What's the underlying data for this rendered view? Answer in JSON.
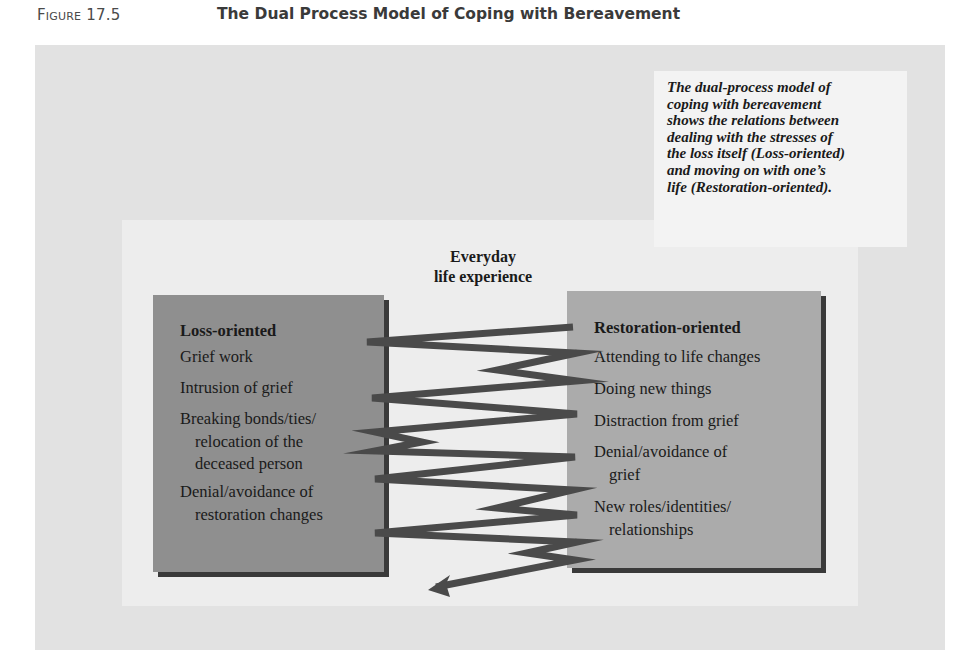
{
  "figure": {
    "label": "Figure 17.5",
    "title": "The Dual Process Model of Coping with Bereavement"
  },
  "caption": "The dual-process model of coping with bereavement shows the relations between dealing with the stresses of the loss itself (Loss-oriented) and moving on with one’s life (Restoration-oriented).",
  "caption_lines": [
    "The dual-process model of",
    "coping with bereavement",
    "shows the relations between",
    "dealing with the stresses of",
    "the loss itself (Loss-oriented)",
    "and moving on with one’s",
    "life (Restoration-oriented)."
  ],
  "center_label": {
    "line1": "Everyday",
    "line2": "life experience"
  },
  "loss_box": {
    "heading": "Loss-oriented",
    "items": [
      {
        "line1": "Grief work",
        "line2": ""
      },
      {
        "line1": "Intrusion of grief",
        "line2": ""
      },
      {
        "line1": "Breaking bonds/ties/",
        "line2": "relocation of the",
        "line3": "deceased person"
      },
      {
        "line1": "Denial/avoidance of",
        "line2": "restoration changes"
      }
    ]
  },
  "restoration_box": {
    "heading": "Restoration-oriented",
    "items": [
      {
        "line1": "Attending to life changes",
        "line2": ""
      },
      {
        "line1": "Doing new things",
        "line2": ""
      },
      {
        "line1": "Distraction from grief",
        "line2": ""
      },
      {
        "line1": "Denial/avoidance of",
        "line2": "grief"
      },
      {
        "line1": "New roles/identities/",
        "line2": "relationships"
      }
    ]
  },
  "colors": {
    "outer_panel": "#e2e2e2",
    "inner_panel": "#ededed",
    "loss_box": "#8f8f8f",
    "restoration_box": "#ababab",
    "oscillation_line": "#4a4a4a",
    "box_shadow": "#3a3a3a"
  },
  "oscillation": {
    "description": "zigzag line oscillating between Loss-oriented and Restoration-oriented boxes, ending in an arrow pointing down-left",
    "points": [
      [
        573,
        327
      ],
      [
        367,
        342
      ],
      [
        577,
        353
      ],
      [
        497,
        370
      ],
      [
        577,
        381
      ],
      [
        372,
        398
      ],
      [
        577,
        414
      ],
      [
        375,
        432
      ],
      [
        422,
        442
      ],
      [
        375,
        451
      ],
      [
        575,
        457
      ],
      [
        375,
        479
      ],
      [
        573,
        490
      ],
      [
        497,
        508
      ],
      [
        577,
        515
      ],
      [
        375,
        533
      ],
      [
        577,
        542
      ],
      [
        527,
        553
      ],
      [
        575,
        560
      ],
      [
        436,
        587
      ]
    ],
    "arrow_tip": [
      428,
      590
    ]
  }
}
